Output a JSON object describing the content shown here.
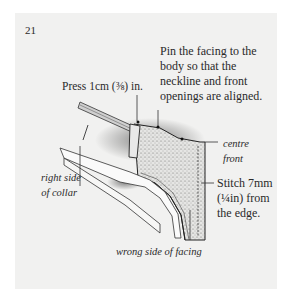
{
  "page": {
    "number": "21",
    "background_color": "#f1f1f0"
  },
  "illustration": {
    "subject": "collar-and-facing-construction-diagram",
    "annotations": {
      "press": "Press 1cm (⅜) in.",
      "pin_lines": [
        "Pin the facing to the",
        "body so that the",
        "neckline and front",
        "openings are aligned."
      ],
      "centre_front_lines": [
        "centre",
        "front"
      ],
      "stitch_lines": [
        "Stitch 7mm",
        "(¼in) from",
        "the edge."
      ],
      "right_side_collar_lines": [
        "right side",
        "of collar"
      ],
      "wrong_side_facing": "wrong side of facing"
    }
  }
}
